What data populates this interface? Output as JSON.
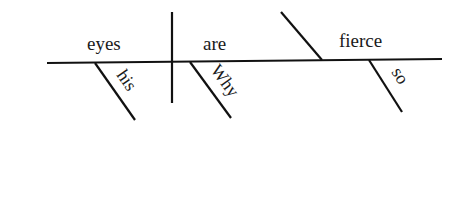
{
  "diagram": {
    "type": "sentence-diagram",
    "sentence_words": [
      "Why",
      "are",
      "his",
      "eyes",
      "so",
      "fierce"
    ],
    "subject": "eyes",
    "verb": "are",
    "predicate_adjective": "fierce",
    "modifiers": {
      "subject_modifier": "his",
      "verb_modifier": "Why",
      "adjective_modifier": "so"
    },
    "line_color": "#111111",
    "text_color": "#1a1a1a",
    "background": "#ffffff"
  }
}
